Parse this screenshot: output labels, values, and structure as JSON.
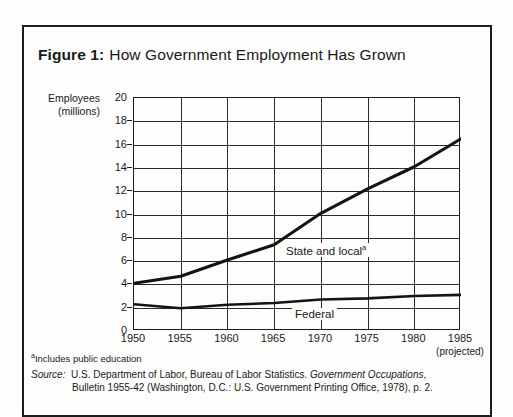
{
  "figure": {
    "label": "Figure 1:",
    "caption": "How Government Employment Has Grown",
    "footnote_marker": "a",
    "footnote_text": "Includes public education",
    "source_prefix": "Source:",
    "source_line_1_a": "U.S. Department of Labor, Bureau of Labor Statistics.",
    "source_line_1_title": "Government Occupations",
    "source_line_1_end": ",",
    "source_line_2": "Bulletin 1955-42 (Washington, D.C.: U.S. Government Printing Office, 1978), p. 2.",
    "projected_note": "(projected)"
  },
  "chart_data": {
    "type": "line",
    "title": "How Government Employment Has Grown",
    "xlabel": "",
    "ylabel": "Employees (millions)",
    "ylabel_line_1": "Employees",
    "ylabel_line_2": "(millions)",
    "x": [
      1950,
      1955,
      1960,
      1965,
      1970,
      1975,
      1980,
      1985
    ],
    "categories": [
      "1950",
      "1955",
      "1960",
      "1965",
      "1970",
      "1975",
      "1980",
      "1985"
    ],
    "xlim": [
      1950,
      1985
    ],
    "ylim": [
      0,
      20
    ],
    "yticks": [
      0,
      2,
      4,
      6,
      8,
      10,
      12,
      14,
      16,
      18,
      20
    ],
    "ytick_labels": [
      "0",
      "2",
      "4",
      "6",
      "8",
      "10",
      "12",
      "14",
      "16",
      "18",
      "20"
    ],
    "grid": true,
    "legend_position": "inline-annotation",
    "series": [
      {
        "name": "State and local",
        "label": "State and local",
        "footnote_marker": "a",
        "values": [
          4.1,
          4.7,
          6.1,
          7.4,
          10.1,
          12.2,
          14.1,
          16.5
        ]
      },
      {
        "name": "Federal",
        "label": "Federal",
        "footnote_marker": "",
        "values": [
          2.3,
          1.95,
          2.25,
          2.4,
          2.7,
          2.8,
          3.0,
          3.1
        ]
      }
    ],
    "annotations": [
      {
        "text": "(projected)",
        "x": 1985,
        "position": "below-axis"
      }
    ]
  },
  "colors": {
    "ink": "#1c1c1c",
    "paper": "#fdfdfc",
    "grid": "#2a2a2a"
  }
}
